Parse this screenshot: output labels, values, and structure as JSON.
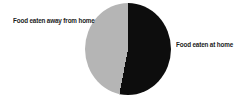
{
  "chart_data": {
    "type": "pie",
    "title": "",
    "legend_position": "none",
    "labels_placement": "outside",
    "start_angle_deg": 0,
    "direction": "clockwise",
    "slices": [
      {
        "label": "Food eaten at home",
        "value": 53,
        "color": "#0d0d0d"
      },
      {
        "label": "Food eaten away from home",
        "value": 47,
        "color": "#b5b5b5"
      }
    ]
  },
  "colors": {
    "at_home_slice": "#0d0d0d",
    "away_slice": "#b5b5b5",
    "background": "#ffffff",
    "label_text": "#1b1b1b"
  }
}
